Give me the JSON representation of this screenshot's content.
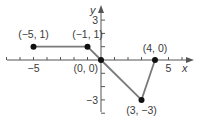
{
  "chart_data": {
    "type": "line",
    "title": "",
    "xlabel": "x",
    "ylabel": "y",
    "xlim": [
      -7,
      7
    ],
    "ylim": [
      -4,
      4
    ],
    "grid": false,
    "x_ticks": [
      -7,
      -6,
      -5,
      -4,
      -3,
      -2,
      -1,
      0,
      1,
      2,
      3,
      4,
      5,
      6
    ],
    "y_ticks": [
      -4,
      -3,
      -2,
      -1,
      0,
      1,
      2,
      3
    ],
    "x_tick_labels": [
      {
        "value": -5,
        "label": "−5"
      },
      {
        "value": 5,
        "label": "5"
      }
    ],
    "y_tick_labels": [
      {
        "value": 3,
        "label": "3"
      },
      {
        "value": -3,
        "label": "−3"
      }
    ],
    "series": [
      {
        "name": "piecewise",
        "color": "#7a7a7a",
        "points": [
          {
            "x": -5,
            "y": 1,
            "label": "(−5, 1)"
          },
          {
            "x": -1,
            "y": 1,
            "label": "(−1, 1)"
          },
          {
            "x": 0,
            "y": 0,
            "label": "(0, 0)"
          },
          {
            "x": 3,
            "y": -3,
            "label": "(3, −3)"
          },
          {
            "x": 4,
            "y": 0,
            "label": "(4, 0)"
          }
        ]
      }
    ]
  },
  "style": {
    "axis_color": "#555555",
    "line_color": "#7a7a7a",
    "point_color": "#111111",
    "text_color": "#3a3a3a"
  }
}
